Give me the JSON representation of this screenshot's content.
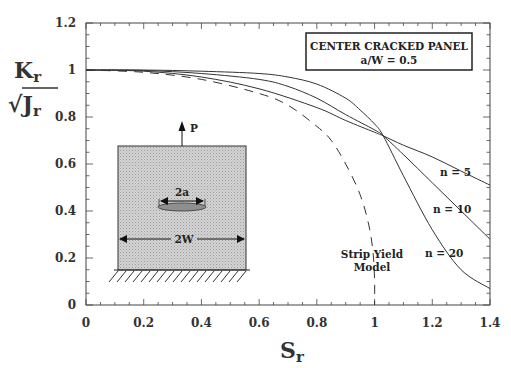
{
  "chart_data": {
    "type": "line",
    "title": "",
    "xlabel": "S_r",
    "ylabel": "K_r / sqrt(J_r)",
    "xlim": [
      0,
      1.4
    ],
    "ylim": [
      0,
      1.2
    ],
    "xticks": [
      "0",
      "0.2",
      "0.4",
      "0.6",
      "0.8",
      "1",
      "1.2",
      "1.4"
    ],
    "yticks": [
      "0",
      "0.2",
      "0.4",
      "0.6",
      "0.8",
      "1",
      "1.2"
    ],
    "grid": false,
    "legend": {
      "line1": "CENTER CRACKED PANEL",
      "line2": "a/W = 0.5",
      "position": "upper right"
    },
    "series": [
      {
        "name": "n = 5",
        "style": "solid",
        "x": [
          0,
          0.2,
          0.4,
          0.6,
          0.8,
          0.9,
          1.0,
          1.03,
          1.1,
          1.2,
          1.3,
          1.4
        ],
        "y": [
          1,
          0.995,
          0.97,
          0.92,
          0.84,
          0.785,
          0.735,
          0.72,
          0.68,
          0.63,
          0.57,
          0.51
        ]
      },
      {
        "name": "n = 10",
        "style": "solid",
        "x": [
          0,
          0.2,
          0.4,
          0.6,
          0.7,
          0.8,
          0.9,
          1.0,
          1.03,
          1.1,
          1.2,
          1.3,
          1.4
        ],
        "y": [
          1,
          0.998,
          0.985,
          0.96,
          0.93,
          0.88,
          0.81,
          0.745,
          0.72,
          0.64,
          0.52,
          0.4,
          0.28
        ]
      },
      {
        "name": "n = 20",
        "style": "solid",
        "x": [
          0,
          0.2,
          0.4,
          0.6,
          0.7,
          0.8,
          0.9,
          0.95,
          1.0,
          1.03,
          1.1,
          1.2,
          1.3,
          1.4
        ],
        "y": [
          1,
          1,
          0.995,
          0.985,
          0.97,
          0.94,
          0.88,
          0.83,
          0.77,
          0.72,
          0.55,
          0.32,
          0.15,
          0.07
        ]
      },
      {
        "name": "Strip Yield Model",
        "style": "dashed",
        "x": [
          0,
          0.2,
          0.4,
          0.6,
          0.7,
          0.8,
          0.85,
          0.9,
          0.95,
          0.98,
          0.995,
          1.0,
          1.0
        ],
        "y": [
          1,
          0.99,
          0.96,
          0.9,
          0.85,
          0.76,
          0.7,
          0.6,
          0.47,
          0.34,
          0.22,
          0.1,
          0.0
        ]
      }
    ],
    "annotations": [
      {
        "text": "n = 5",
        "x": 1.24,
        "y": 0.54
      },
      {
        "text": "n = 10",
        "x": 1.17,
        "y": 0.37
      },
      {
        "text": "n = 20",
        "x": 1.12,
        "y": 0.22
      },
      {
        "text": "Strip Yield Model",
        "x": 0.97,
        "y": 0.27
      }
    ],
    "inset": {
      "load_label": "P",
      "crack_label": "2a",
      "width_label": "2W"
    }
  },
  "axes": {
    "y_title_main": "K",
    "y_title_main_sub": "r",
    "y_title_sqrt": "√J",
    "y_title_sqrt_sub": "r",
    "x_title_main": "S",
    "x_title_sub": "r"
  },
  "labels": {
    "strip_line1": "Strip Yield",
    "strip_line2": "Model"
  }
}
